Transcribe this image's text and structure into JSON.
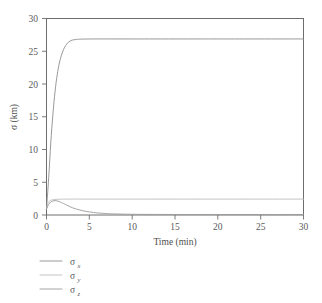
{
  "chart_data": {
    "type": "line",
    "title": "",
    "xlabel": "Time (min)",
    "ylabel": "σ (km)",
    "xlim": [
      0,
      30
    ],
    "ylim": [
      0,
      30
    ],
    "xticks": [
      0,
      5,
      10,
      15,
      20,
      25,
      30
    ],
    "yticks": [
      0,
      5,
      10,
      15,
      20,
      25,
      30
    ],
    "xtick_labels": [
      "0",
      "5",
      "10",
      "15",
      "20",
      "25",
      "30"
    ],
    "ytick_labels": [
      "0",
      "5",
      "10",
      "15",
      "20",
      "25",
      "30"
    ],
    "grid": false,
    "legend_position": "below-left",
    "frame": "box",
    "series": [
      {
        "name": "σ_x",
        "label_base": "σ",
        "label_sub": "x",
        "color": "#8c8c8c",
        "x": [
          0,
          0.15,
          0.3,
          0.5,
          0.75,
          1.0,
          1.25,
          1.5,
          1.75,
          2.0,
          2.25,
          2.5,
          2.75,
          3.0,
          3.5,
          4.0,
          5.0,
          6.0,
          8.0,
          10.0,
          12.0,
          15.0,
          18.0,
          20.0,
          24.0,
          27.0,
          30.0
        ],
        "y": [
          1.0,
          3.6,
          6.6,
          11.0,
          15.4,
          18.9,
          21.4,
          23.2,
          24.4,
          25.3,
          25.9,
          26.3,
          26.55,
          26.7,
          26.8,
          26.85,
          26.87,
          26.88,
          26.88,
          26.88,
          26.88,
          26.88,
          26.88,
          26.88,
          26.88,
          26.88,
          26.88
        ]
      },
      {
        "name": "σ_y",
        "label_base": "σ",
        "label_sub": "y",
        "color": "#bdbdbd",
        "x": [
          0,
          0.2,
          0.5,
          1.0,
          2.0,
          3.0,
          5.0,
          8.0,
          12.0,
          16.0,
          20.0,
          25.0,
          30.0
        ],
        "y": [
          1.0,
          1.9,
          2.25,
          2.38,
          2.42,
          2.43,
          2.43,
          2.43,
          2.43,
          2.43,
          2.43,
          2.43,
          2.43
        ]
      },
      {
        "name": "σ_z",
        "label_base": "σ",
        "label_sub": "z",
        "color": "#9a9a9a",
        "x": [
          0,
          0.25,
          0.5,
          0.75,
          1.0,
          1.25,
          1.5,
          1.75,
          2.0,
          2.5,
          3.0,
          3.5,
          4.0,
          4.5,
          5.0,
          5.5,
          6.0,
          6.5,
          7.0,
          8.0,
          9.0,
          10.0,
          12.0,
          15.0,
          20.0,
          25.0,
          30.0
        ],
        "y": [
          0.9,
          1.6,
          2.0,
          2.15,
          2.2,
          2.15,
          2.05,
          1.9,
          1.75,
          1.42,
          1.12,
          0.9,
          0.72,
          0.58,
          0.47,
          0.38,
          0.31,
          0.26,
          0.22,
          0.16,
          0.13,
          0.11,
          0.09,
          0.08,
          0.07,
          0.07,
          0.07
        ]
      }
    ]
  },
  "figure": {
    "background": "#ffffff",
    "axis_color": "#6d6d6d"
  }
}
